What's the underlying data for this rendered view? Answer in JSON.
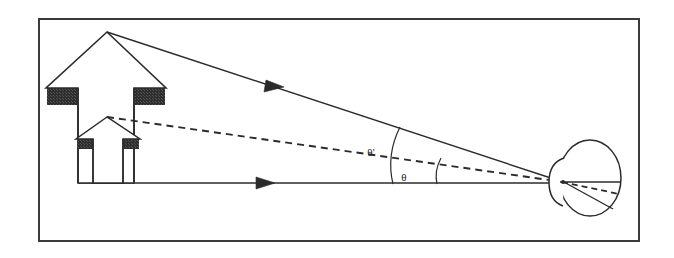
{
  "figure": {
    "kind": "optics-ray-diagram",
    "frame": {
      "name": "figure-border",
      "x": 38,
      "y": 18,
      "width": 602,
      "height": 224,
      "stroke": "#3a3a3a",
      "stroke_width": 2,
      "fill": "#ffffff"
    },
    "colors": {
      "line": "#2b2b2b",
      "fill_block": "#2e2e2e",
      "background": "#ffffff",
      "border": "#3a3a3a"
    },
    "optical_axis": {
      "name": "optical-axis",
      "x1": 78,
      "y1": 183,
      "x2": 563,
      "y2": 183
    },
    "objects": [
      {
        "name": "large-arrow-object",
        "label": "large distant arrow",
        "tip": {
          "x": 107,
          "y": 32
        },
        "baseline_y": 183,
        "shaft_left_x": 78,
        "shaft_right_x": 134,
        "barb_y_top": 88,
        "barb_y_bottom": 105,
        "barb_outer_left_x": 46,
        "barb_outer_right_x": 166,
        "block_left": {
          "x": 46,
          "y": 88,
          "width": 32,
          "height": 17
        },
        "block_right": {
          "x": 134,
          "y": 88,
          "width": 32,
          "height": 17
        }
      },
      {
        "name": "small-arrow-object",
        "label": "small near arrow",
        "tip": {
          "x": 107,
          "y": 117
        },
        "baseline_y": 183,
        "shaft_left_x": 93,
        "shaft_right_x": 123,
        "barb_y_top": 139,
        "barb_y_bottom": 149,
        "barb_outer_left_x": 76,
        "barb_outer_right_x": 140,
        "block_left": {
          "x": 76,
          "y": 139,
          "width": 17,
          "height": 10
        },
        "block_right": {
          "x": 123,
          "y": 139,
          "width": 17,
          "height": 10
        }
      }
    ],
    "rays": [
      {
        "name": "chief-ray-large-object",
        "style": "solid",
        "from": {
          "x": 107,
          "y": 32
        },
        "to": {
          "x": 563,
          "y": 182
        },
        "arrowhead_at": {
          "x": 275,
          "y": 86
        },
        "arrowhead": true
      },
      {
        "name": "chief-ray-small-object",
        "style": "dashed",
        "from": {
          "x": 107,
          "y": 117
        },
        "to": {
          "x": 563,
          "y": 182
        },
        "arrowhead": false,
        "dash_pattern": "7 5"
      },
      {
        "name": "axis-ray",
        "style": "solid",
        "from": {
          "x": 78,
          "y": 183
        },
        "to": {
          "x": 563,
          "y": 183
        },
        "arrowhead_at": {
          "x": 268,
          "y": 183
        },
        "arrowhead": true
      }
    ],
    "angles": [
      {
        "name": "angle-theta-prime",
        "label": "θ'",
        "label_x": 374,
        "label_y": 152,
        "vertex": {
          "x": 563,
          "y": 182
        },
        "arc_top": {
          "x": 398,
          "y": 128
        },
        "arc_bottom": {
          "x": 392,
          "y": 183
        },
        "description": "visual angle subtended by the large far arrow"
      },
      {
        "name": "angle-theta",
        "label": "θ",
        "label_x": 402,
        "label_y": 177,
        "vertex": {
          "x": 563,
          "y": 182
        },
        "arc_top": {
          "x": 440,
          "y": 160
        },
        "arc_bottom": {
          "x": 437,
          "y": 183
        },
        "description": "visual angle subtended by the small near arrow"
      }
    ],
    "eye": {
      "name": "eye-diagram",
      "globe": {
        "cx": 589,
        "cy": 178,
        "rx": 31,
        "ry": 38
      },
      "nodal_point": {
        "x": 563,
        "y": 182
      },
      "cornea": {
        "name": "cornea-bulge",
        "path": "M 561 163 Q 549 166 549 182 Q 549 198 561 201"
      },
      "retinal_axis": {
        "x1": 560,
        "y1": 182,
        "x2": 620,
        "y2": 182
      },
      "image_rays": [
        {
          "name": "retinal-image-ray-solid",
          "style": "solid",
          "from": {
            "x": 563,
            "y": 182
          },
          "to": {
            "x": 612,
            "y": 208
          }
        },
        {
          "name": "retinal-image-ray-dashed",
          "style": "dashed",
          "from": {
            "x": 563,
            "y": 182
          },
          "to": {
            "x": 618,
            "y": 193
          },
          "dash_pattern": "6 4"
        }
      ]
    }
  }
}
